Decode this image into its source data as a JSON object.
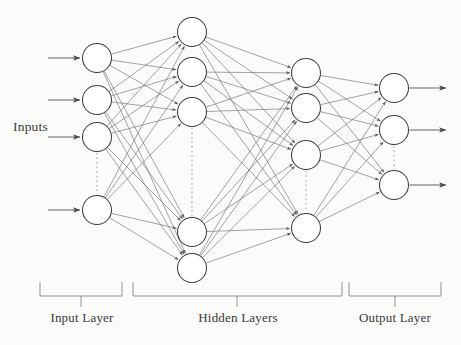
{
  "figure": {
    "background_color": "#fbfbfa",
    "ink_color": "#4a4a48",
    "node_fill": "#ffffff",
    "node_stroke": "#3c3c3a",
    "edge_color": "#6b6b69",
    "dotted_color": "#a9a9a6"
  },
  "annotations": {
    "inputs_label": "Inputs"
  },
  "brackets": [
    {
      "name": "input-layer",
      "label": "Input Layer",
      "x1": 40,
      "x2": 122,
      "y": 282,
      "tick_x": 81
    },
    {
      "name": "hidden-layers",
      "label": "Hidden Layers",
      "x1": 133,
      "x2": 342,
      "y": 282,
      "tick_x": 237
    },
    {
      "name": "output-layer",
      "label": "Output Layer",
      "x1": 349,
      "x2": 441,
      "y": 282,
      "tick_x": 395
    }
  ],
  "network": {
    "node_radius": 14.5,
    "layers": [
      {
        "name": "input",
        "label": "Input Layer",
        "x": 97,
        "visible_node_count": 4,
        "nodes_y": [
          58,
          100,
          137,
          210
        ],
        "ellipsis": {
          "between_indices": [
            2,
            3
          ],
          "y_from": 153,
          "y_to": 194
        },
        "incoming_arrows": {
          "from_x": 48,
          "count": 4
        }
      },
      {
        "name": "hidden-1",
        "label": "Hidden Layer 1",
        "x": 192,
        "visible_node_count": 5,
        "nodes_y": [
          32,
          72,
          112,
          232,
          268
        ],
        "ellipsis": {
          "between_indices": [
            2,
            3
          ],
          "y_from": 128,
          "y_to": 216
        }
      },
      {
        "name": "hidden-2",
        "label": "Hidden Layer 2",
        "x": 306,
        "visible_node_count": 4,
        "nodes_y": [
          73,
          108,
          155,
          228
        ],
        "ellipsis": {
          "between_indices": [
            2,
            3
          ],
          "y_from": 171,
          "y_to": 212
        }
      },
      {
        "name": "output",
        "label": "Output Layer",
        "x": 394,
        "visible_node_count": 3,
        "nodes_y": [
          88,
          130,
          185
        ],
        "ellipsis": {
          "between_indices": [
            1,
            2
          ],
          "y_from": 146,
          "y_to": 169
        },
        "outgoing_arrows": {
          "to_x": 446,
          "count": 3
        }
      }
    ],
    "connections": [
      {
        "from": "input",
        "to": "hidden-1",
        "type": "fully-connected",
        "arrowheads": true
      },
      {
        "from": "hidden-1",
        "to": "hidden-2",
        "type": "fully-connected",
        "arrowheads": true
      },
      {
        "from": "hidden-2",
        "to": "output",
        "type": "fully-connected",
        "arrowheads": true
      }
    ]
  }
}
